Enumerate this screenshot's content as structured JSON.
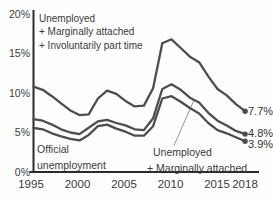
{
  "chart_data": {
    "type": "line",
    "title": "",
    "xlabel": "",
    "ylabel": "",
    "x": [
      1995,
      1996,
      1997,
      1998,
      1999,
      2000,
      2001,
      2002,
      2003,
      2004,
      2005,
      2006,
      2007,
      2008,
      2009,
      2010,
      2011,
      2012,
      2013,
      2014,
      2015,
      2016,
      2017,
      2018
    ],
    "series": [
      {
        "name": "Unemployed + Marginally attached + Involuntarily part time",
        "values": [
          10.8,
          10.4,
          9.6,
          8.7,
          7.8,
          7.2,
          7.3,
          9.3,
          10.3,
          9.9,
          9.0,
          8.3,
          8.4,
          10.6,
          16.3,
          16.8,
          15.7,
          14.6,
          13.9,
          12.1,
          10.5,
          9.7,
          8.6,
          7.7
        ],
        "end_label": "7.7%"
      },
      {
        "name": "Unemployed + Marginally attached",
        "values": [
          6.7,
          6.5,
          6.0,
          5.4,
          5.0,
          4.8,
          5.6,
          6.4,
          6.6,
          6.2,
          5.9,
          5.4,
          5.3,
          6.8,
          10.5,
          11.1,
          10.4,
          9.4,
          8.8,
          7.5,
          6.5,
          5.9,
          5.2,
          4.8
        ],
        "end_label": "4.8%"
      },
      {
        "name": "Official unemployment",
        "values": [
          5.6,
          5.4,
          4.9,
          4.5,
          4.2,
          4.0,
          4.7,
          5.8,
          6.0,
          5.5,
          5.1,
          4.6,
          4.6,
          5.8,
          9.3,
          9.6,
          8.9,
          8.1,
          7.4,
          6.2,
          5.3,
          4.9,
          4.4,
          3.9
        ],
        "end_label": "3.9%"
      }
    ],
    "ylim": [
      0,
      20
    ],
    "yticks": [
      "20%",
      "15%",
      "10%",
      "5%",
      "0%"
    ],
    "ytick_values": [
      20,
      15,
      10,
      5,
      0
    ],
    "xticks": [
      "1995",
      "2000",
      "2005",
      "2010",
      "2015",
      "2018"
    ],
    "xtick_values": [
      1995,
      2000,
      2005,
      2010,
      2015,
      2018
    ],
    "grid": "off",
    "legend_position": "annotations-inline",
    "line_color": "#4d4d4d",
    "axis_color": "#2b2b2b",
    "leader_color": "#8a8a8a",
    "annotations": {
      "u6": {
        "lines": [
          "Unemployed",
          "+ Marginally attached",
          "+ Involuntarily part time"
        ]
      },
      "official": {
        "lines": [
          "Official",
          "unemployment"
        ]
      },
      "u5": {
        "lines": [
          "Unemployed",
          "+ Marginally attached"
        ]
      }
    }
  }
}
